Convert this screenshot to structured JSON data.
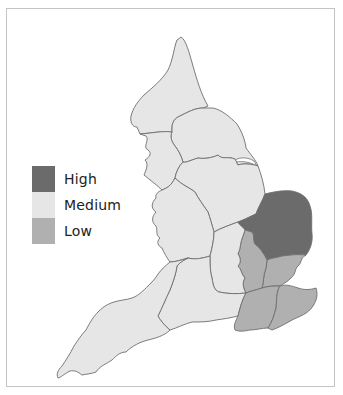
{
  "colors": {
    "high": "#6b6b6b",
    "medium": "#e6e6e6",
    "low": "#b0b0b0",
    "outline": "#6e6e6e",
    "frame": "#c4c4c4"
  },
  "legend": {
    "items": [
      {
        "label": "High",
        "level": "high",
        "color": "#6b6b6b"
      },
      {
        "label": "Medium",
        "level": "medium",
        "color": "#e6e6e6"
      },
      {
        "label": "Low",
        "level": "low",
        "color": "#b0b0b0"
      }
    ]
  },
  "map": {
    "regions": [
      {
        "id": "north-east",
        "level": "medium"
      },
      {
        "id": "north-west",
        "level": "medium"
      },
      {
        "id": "yorkshire-humber",
        "level": "medium"
      },
      {
        "id": "east-midlands",
        "level": "medium"
      },
      {
        "id": "west-midlands",
        "level": "medium"
      },
      {
        "id": "east-of-england-north",
        "level": "high"
      },
      {
        "id": "east-of-england-south",
        "level": "low"
      },
      {
        "id": "london-west",
        "level": "low"
      },
      {
        "id": "south-east-west",
        "level": "low"
      },
      {
        "id": "south-east-east",
        "level": "low"
      },
      {
        "id": "south-central",
        "level": "medium"
      },
      {
        "id": "south-midlands",
        "level": "medium"
      },
      {
        "id": "south-west",
        "level": "medium"
      }
    ]
  }
}
